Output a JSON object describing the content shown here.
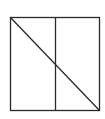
{
  "diagram": {
    "stroke_color": "#2a2a2a",
    "background": "#ffffff",
    "square": {
      "x1": 10.5,
      "y1": 17.5,
      "x2": 99.5,
      "y2": 110.5
    },
    "divider_x": 55.5,
    "diagonal": {
      "from": "top-left",
      "to": "bottom-right"
    }
  }
}
